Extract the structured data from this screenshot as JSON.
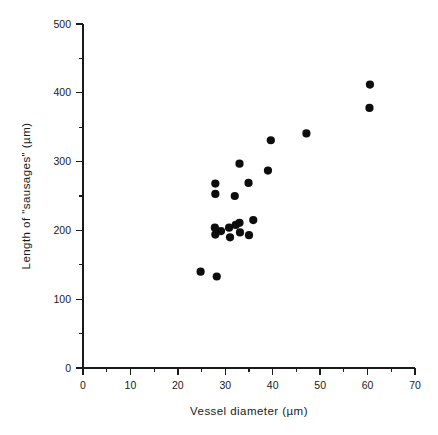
{
  "chart_data": {
    "type": "scatter",
    "title": "",
    "xlabel": "Vessel diameter (µm)",
    "ylabel": "Length of \"sausages\" (µm)",
    "xlim": [
      0,
      70
    ],
    "ylim": [
      0,
      500
    ],
    "grid": false,
    "legend": null,
    "x_ticks": [
      0,
      10,
      20,
      30,
      40,
      50,
      60,
      70
    ],
    "x_tick_labels": [
      "0",
      "10",
      "20",
      "30",
      "40",
      "50",
      "60",
      "70"
    ],
    "x_minor_tick_interval": 5,
    "y_ticks": [
      0,
      100,
      200,
      300,
      400,
      500
    ],
    "y_tick_labels": [
      "0",
      "100",
      "200",
      "300",
      "400",
      "500"
    ],
    "y_minor_tick_interval": 50,
    "marker": "filled-circle",
    "marker_color": "#0d0d0d",
    "marker_size_px": 4.1,
    "n_points": 22,
    "points": [
      {
        "x": 24.8,
        "y": 140
      },
      {
        "x": 28.2,
        "y": 133
      },
      {
        "x": 27.9,
        "y": 268
      },
      {
        "x": 27.9,
        "y": 253
      },
      {
        "x": 27.8,
        "y": 204
      },
      {
        "x": 27.9,
        "y": 194
      },
      {
        "x": 30.8,
        "y": 204
      },
      {
        "x": 31.0,
        "y": 190
      },
      {
        "x": 32.0,
        "y": 250
      },
      {
        "x": 33.0,
        "y": 297
      },
      {
        "x": 33.0,
        "y": 211
      },
      {
        "x": 33.1,
        "y": 197
      },
      {
        "x": 34.9,
        "y": 269
      },
      {
        "x": 35.0,
        "y": 193
      },
      {
        "x": 35.9,
        "y": 215
      },
      {
        "x": 39.6,
        "y": 331
      },
      {
        "x": 39.0,
        "y": 287
      },
      {
        "x": 47.1,
        "y": 341
      },
      {
        "x": 60.5,
        "y": 412
      },
      {
        "x": 60.4,
        "y": 378
      },
      {
        "x": 29.1,
        "y": 199
      },
      {
        "x": 32.2,
        "y": 208
      }
    ],
    "series": [
      {
        "name": "sausage length vs vessel diameter",
        "x": [
          24.8,
          28.2,
          27.9,
          27.9,
          27.8,
          27.9,
          30.8,
          31.0,
          32.0,
          33.0,
          33.0,
          33.1,
          34.9,
          35.0,
          35.9,
          39.6,
          39.0,
          47.1,
          60.5,
          60.4,
          29.1,
          32.2
        ],
        "y": [
          140,
          133,
          268,
          253,
          204,
          194,
          204,
          190,
          250,
          297,
          211,
          197,
          269,
          193,
          215,
          331,
          287,
          341,
          412,
          378,
          199,
          208
        ]
      }
    ]
  },
  "figure": {
    "background_color": "#ffffff",
    "axis_color": "#1a1a1a",
    "geometry": {
      "x_axis_px_min": 83,
      "x_axis_px_max": 415,
      "y_axis_px_min": 368,
      "y_axis_px_max": 24
    }
  }
}
